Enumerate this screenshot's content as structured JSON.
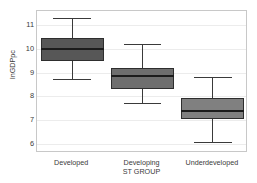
{
  "chart_data": {
    "type": "box",
    "title": "",
    "xlabel": "ST GROUP",
    "ylabel": "lnGDPpc",
    "ylim": [
      5.6,
      11.6
    ],
    "yticks": [
      6,
      7,
      8,
      9,
      10,
      11
    ],
    "ytick_labels": [
      "6",
      "7",
      "8",
      "9",
      "10",
      "11"
    ],
    "grid": true,
    "legend": "none",
    "categories": [
      "Developed",
      "Developing",
      "Underdeveloped"
    ],
    "boxes": [
      {
        "category": "Developed",
        "whisker_low": 8.73,
        "q1": 9.47,
        "median": 10.0,
        "q3": 10.48,
        "whisker_high": 11.32,
        "fill": "#575757"
      },
      {
        "category": "Developing",
        "whisker_low": 7.73,
        "q1": 8.32,
        "median": 8.85,
        "q3": 9.2,
        "whisker_high": 10.21,
        "fill": "#6e6e6e"
      },
      {
        "category": "Underdeveloped",
        "whisker_low": 6.08,
        "q1": 7.02,
        "median": 7.38,
        "q3": 7.93,
        "whisker_high": 8.83,
        "fill": "#808080"
      }
    ]
  },
  "axis": {
    "frame_color": "#c8c8c8",
    "grid_color": "#ececec",
    "text_color": "#3a3a3a"
  }
}
